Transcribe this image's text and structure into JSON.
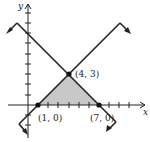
{
  "diagram": {
    "axes": {
      "x_label": "x",
      "y_label": "y"
    },
    "region_color": "#c8c8c8",
    "line_color": "#222222",
    "lines": [
      {
        "name": "decreasing line",
        "passes_through": [
          "(4, 3)",
          "(7, 0)"
        ]
      },
      {
        "name": "increasing line",
        "passes_through": [
          "(1, 0)",
          "(4, 3)"
        ]
      }
    ],
    "points": [
      {
        "label": "(4, 3)",
        "x": 4,
        "y": 3
      },
      {
        "label": "(1, 0)",
        "x": 1,
        "y": 0
      },
      {
        "label": "(7, 0)",
        "x": 7,
        "y": 0
      }
    ],
    "shaded_region": "triangle with vertices (1, 0), (4, 3), (7, 0)"
  }
}
